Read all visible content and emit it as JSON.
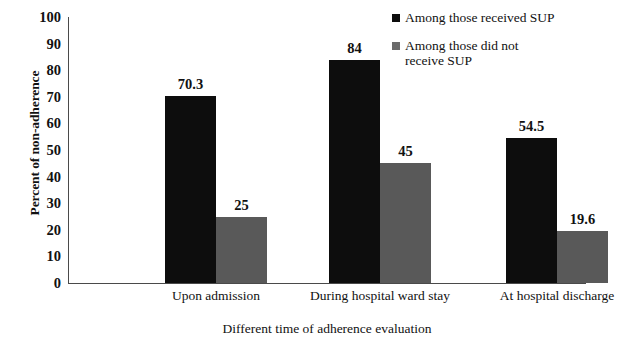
{
  "chart_data": {
    "type": "bar",
    "title": "",
    "xlabel": "Different time of adherence evaluation",
    "ylabel": "Percent of non-adherence",
    "categories": [
      "Upon admission",
      "During hospital ward stay",
      "At hospital discharge"
    ],
    "series": [
      {
        "name": "Among those received SUP",
        "color": "#0d0d0d",
        "values": [
          70.3,
          84,
          54.5
        ],
        "labels": [
          "70.3",
          "84",
          "54.5"
        ]
      },
      {
        "name": "Among those did not receive SUP",
        "color": "#595959",
        "values": [
          25,
          45,
          19.6
        ],
        "labels": [
          "25",
          "45",
          "19.6"
        ]
      }
    ],
    "ylim": [
      0,
      100
    ],
    "yticks": [
      0,
      10,
      20,
      30,
      40,
      50,
      60,
      70,
      80,
      90,
      100
    ],
    "ytick_labels": [
      "0",
      "10",
      "20",
      "30",
      "40",
      "50",
      "60",
      "70",
      "80",
      "90",
      "100"
    ],
    "grid": false,
    "legend_position": "top-right",
    "bar_gap_within_group": 0
  },
  "legend": {
    "entries": [
      {
        "label": "Among those received SUP",
        "swatch": "black-square-icon",
        "wrap": false
      },
      {
        "label": "Among those did not receive SUP",
        "swatch": "gray-square-icon",
        "wrap": true
      }
    ]
  }
}
